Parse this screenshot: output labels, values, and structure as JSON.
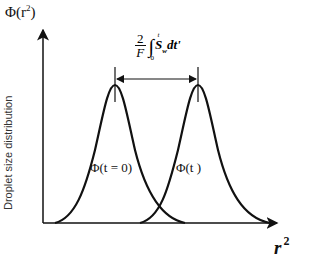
{
  "diagram": {
    "y_axis": {
      "name": "Φ(r²)",
      "name_base": "Φ(r",
      "name_sup": "2",
      "name_close": ")",
      "label": "Droplet size distribution"
    },
    "x_axis": {
      "name_base": "r",
      "name_sup": "2"
    },
    "curves": [
      {
        "label": "Φ(t = 0)",
        "peak_x": 115
      },
      {
        "label": "Φ(t )",
        "peak_x": 198
      }
    ],
    "shift_annotation": {
      "numerator": "2",
      "denominator": "F",
      "integral_upper": "t",
      "integral_lower": "0",
      "integrand": "S",
      "integrand_sub": "w",
      "differential": "dt'"
    }
  }
}
